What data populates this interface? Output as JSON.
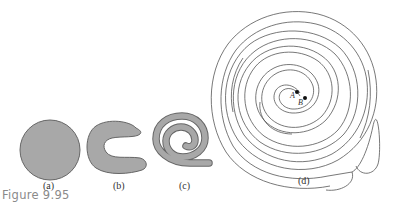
{
  "figure": {
    "caption": "Figure 9.95",
    "panels": [
      {
        "id": "a",
        "label": "(a)",
        "shape": "filled circle"
      },
      {
        "id": "b",
        "label": "(b)",
        "shape": "C-shaped blob"
      },
      {
        "id": "c",
        "label": "(c)",
        "shape": "filled spiral"
      },
      {
        "id": "d",
        "label": "(d)",
        "shape": "spiral maze with points A and B"
      }
    ],
    "points": {
      "a": "A",
      "b": "B"
    },
    "fill_color": "#a8a8a8",
    "stroke_color": "#555555"
  }
}
